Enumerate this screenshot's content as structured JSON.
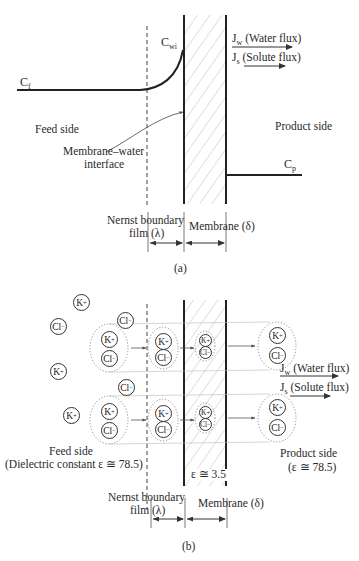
{
  "figure_a": {
    "labels": {
      "cf": "C",
      "cf_sub": "f",
      "cwi": "C",
      "cwi_sub": "wi",
      "cp": "C",
      "cp_sub": "p",
      "jw": "J",
      "jw_sub": "w",
      "jw_text": " (Water flux)",
      "js": "J",
      "js_sub": "s",
      "js_text": " (Solute flux)",
      "feed_side": "Feed side",
      "product_side": "Product side",
      "interface_line1": "Membrane–water",
      "interface_line2": "interface",
      "nernst_line1": "Nernst boundary",
      "nernst_line2": "film (λ)",
      "membrane": "Membrane (δ)",
      "caption": "(a)"
    }
  },
  "figure_b": {
    "labels": {
      "jw": "J",
      "jw_sub": "w",
      "jw_text": " (Water flux)",
      "js": "J",
      "js_sub": "s",
      "js_text": " (Solute flux)",
      "feed_side": "Feed side",
      "feed_dielectric": "(Dielectric constant ε ≅ 78.5)",
      "product_side": "Product side",
      "product_dielectric": "(ε ≅ 78.5)",
      "membrane_dielectric": "ε ≅ 3.5",
      "nernst_line1": "Nernst boundary",
      "nernst_line2": "film (λ)",
      "membrane": "Membrane (δ)",
      "caption": "(b)"
    },
    "ions": {
      "k": "K",
      "k_charge": "+",
      "cl": "Cl",
      "cl_charge": "−"
    }
  }
}
